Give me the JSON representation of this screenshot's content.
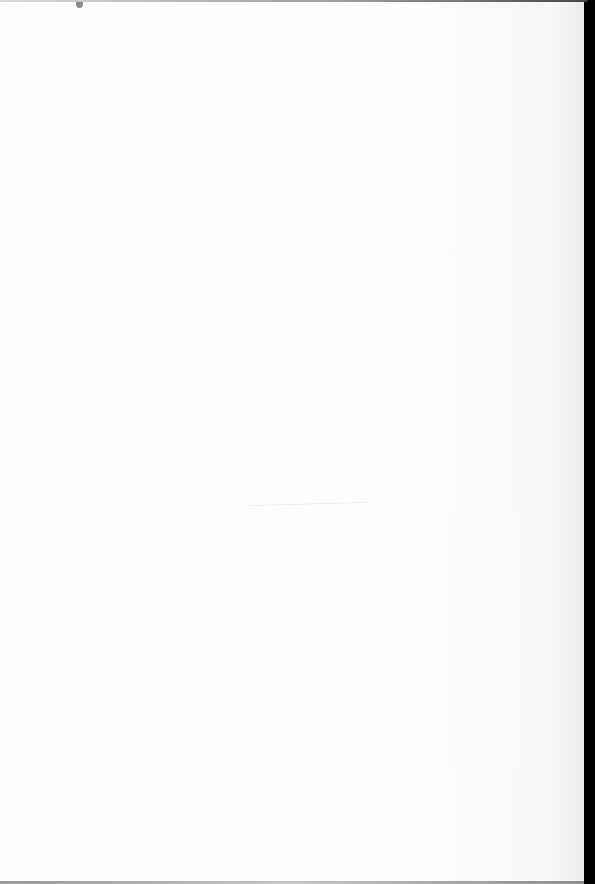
{
  "document": {
    "type": "blank scanned page",
    "text_content": "",
    "colors": {
      "paper": "#fdfdfd",
      "border": "#000000",
      "edge_line": "#9a9a9a",
      "speck": "#8a8a8a"
    }
  }
}
